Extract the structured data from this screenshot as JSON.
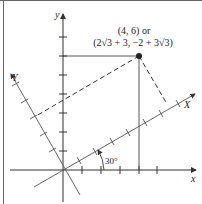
{
  "figure": {
    "point_label_line1": "(4, 6) or",
    "point_label_line2": "(2√3 + 3, −2 + 3√3)",
    "angle_label": "30°",
    "axes": {
      "x_label": "x",
      "y_label": "y",
      "X_label": "X",
      "Y_label": "Y"
    },
    "point": {
      "x": 4,
      "y": 6
    },
    "rotation_degrees": 30,
    "colors": {
      "axis": "#333333",
      "frame": "#555555",
      "point": "#222222"
    }
  }
}
